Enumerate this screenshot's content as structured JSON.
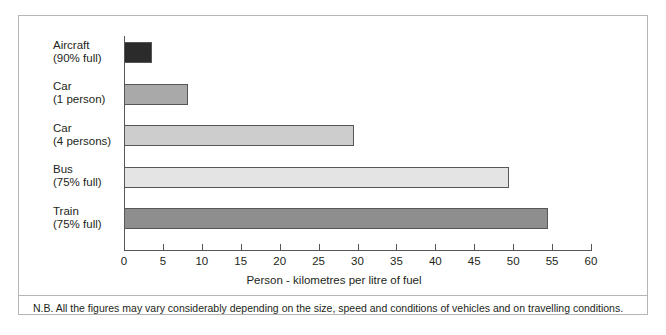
{
  "chart_data": {
    "type": "bar",
    "orientation": "horizontal",
    "title": "",
    "subtitle": "",
    "xlabel": "Person - kilometres per litre of fuel",
    "ylabel": "",
    "xlim": [
      0,
      60
    ],
    "xticks": [
      0,
      5,
      10,
      15,
      20,
      25,
      30,
      35,
      40,
      45,
      50,
      55,
      60
    ],
    "grid": false,
    "legend": "none",
    "categories": [
      "Aircraft\n(90% full)",
      "Car\n(1 person)",
      "Car\n(4 persons)",
      "Bus\n(75% full)",
      "Train\n(75% full)"
    ],
    "values": [
      3.6,
      8.2,
      29.5,
      49.5,
      54.5
    ],
    "colors": [
      "#2b2b2b",
      "#a9a9a9",
      "#cdcdcd",
      "#e4e4e4",
      "#8e8e8e"
    ],
    "bar_edge_color": "#565656",
    "axis_color": "#565656"
  },
  "footnote": "N.B. All the figures may vary considerably depending on the size, speed and conditions of vehicles and on travelling conditions.",
  "frame": {
    "border_color": "#b5b5b5",
    "background": "#ffffff"
  }
}
